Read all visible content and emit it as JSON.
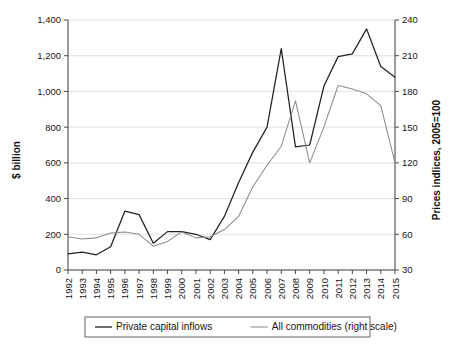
{
  "chart_data": {
    "type": "line",
    "title": "",
    "xlabel": "",
    "ylabel": "$ billion",
    "y2label": "Prices indlices, 2005=100",
    "grid": true,
    "legend_position": "bottom",
    "x": [
      1992,
      1993,
      1994,
      1995,
      1996,
      1997,
      1998,
      1999,
      2000,
      2001,
      2002,
      2003,
      2004,
      2005,
      2006,
      2007,
      2008,
      2009,
      2010,
      2011,
      2012,
      2013,
      2014,
      2015
    ],
    "categories": [
      "1992",
      "1993",
      "1994",
      "1995",
      "1996",
      "1997",
      "1998",
      "1999",
      "2000",
      "2001",
      "2002",
      "2003",
      "2004",
      "2005",
      "2006",
      "2007",
      "2008",
      "2009",
      "2010",
      "2011",
      "2012",
      "2013",
      "2014",
      "2015"
    ],
    "ylim": [
      0,
      1400
    ],
    "yticks": [
      0,
      200,
      400,
      600,
      800,
      1000,
      1200,
      1400
    ],
    "ytick_labels": [
      "0",
      "200",
      "400",
      "600",
      "800",
      "1,000",
      "1,200",
      "1,400"
    ],
    "y2lim": [
      30,
      240
    ],
    "y2ticks": [
      30,
      60,
      90,
      120,
      150,
      180,
      210,
      240
    ],
    "y2tick_labels": [
      "30",
      "60",
      "90",
      "120",
      "150",
      "180",
      "210",
      "240"
    ],
    "series": [
      {
        "name": "Private capital inflows",
        "axis": "left",
        "color": "#222222",
        "values": [
          90,
          100,
          85,
          130,
          330,
          310,
          150,
          215,
          215,
          200,
          170,
          300,
          490,
          660,
          800,
          1240,
          690,
          700,
          1030,
          1195,
          1210,
          1350,
          1140,
          1080
        ]
      },
      {
        "name": "All commodities (right scale)",
        "axis": "right",
        "color": "#8c8c8c",
        "values": [
          58,
          56,
          57,
          61,
          62,
          60,
          50,
          54,
          62,
          57,
          58,
          64,
          75,
          100,
          118,
          134,
          172,
          120,
          150,
          185,
          182,
          178,
          168,
          120
        ]
      }
    ],
    "legend": [
      {
        "label": "Private capital inflows",
        "color": "#222222"
      },
      {
        "label": "All commodities (right scale)",
        "color": "#8c8c8c"
      }
    ]
  },
  "axes": {
    "left_title": "$ billion",
    "right_title": "Prices indlices, 2005=100"
  }
}
